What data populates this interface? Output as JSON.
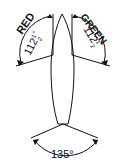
{
  "diagram": {
    "port": {
      "label": "RED",
      "angle": "112",
      "fraction": "1/2",
      "degree": "°"
    },
    "starboard": {
      "label": "GREEN",
      "angle": "112",
      "fraction": "1/2",
      "degree": "°"
    },
    "stern": {
      "label": "135°"
    }
  }
}
